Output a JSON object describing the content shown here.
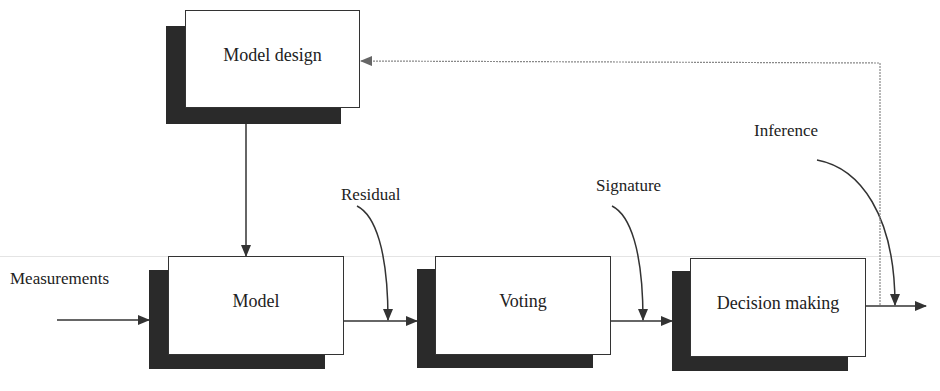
{
  "diagram": {
    "type": "block-flow",
    "blocks": {
      "model_design": {
        "label": "Model design"
      },
      "model": {
        "label": "Model"
      },
      "voting": {
        "label": "Voting"
      },
      "decision_making": {
        "label": "Decision making"
      }
    },
    "signals": {
      "measurements": "Measurements",
      "residual": "Residual",
      "signature": "Signature",
      "inference": "Inference"
    },
    "edges": [
      {
        "from": "Measurements",
        "to": "Model"
      },
      {
        "from": "Model design",
        "to": "Model"
      },
      {
        "from": "Model",
        "to": "Voting",
        "signal": "Residual"
      },
      {
        "from": "Voting",
        "to": "Decision making",
        "signal": "Signature"
      },
      {
        "from": "Decision making",
        "to": "output",
        "signal": "Inference"
      },
      {
        "from": "Decision making",
        "to": "Model design",
        "style": "dotted feedback"
      }
    ],
    "colors": {
      "line": "#333333",
      "shadow": "#2a2a2a",
      "feedback": "#888888"
    }
  }
}
